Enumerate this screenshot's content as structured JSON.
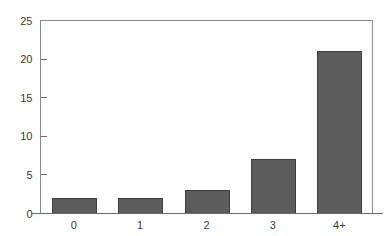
{
  "chart_data": {
    "type": "bar",
    "title": "",
    "subtitle": "",
    "xlabel": "",
    "ylabel": "",
    "categories": [
      "0",
      "1",
      "2",
      "3",
      "4+"
    ],
    "values": [
      2,
      2,
      3,
      7,
      21
    ],
    "series": [
      {
        "name": "",
        "values": [
          2,
          2,
          3,
          7,
          21
        ]
      }
    ],
    "ylim": [
      0,
      25
    ],
    "y_ticks": [
      0,
      5,
      10,
      15,
      20,
      25
    ],
    "y_tick_labels": [
      "0",
      "5",
      "10",
      "15",
      "20",
      "25"
    ],
    "x_tick_labels": [
      "0",
      "1",
      "2",
      "3",
      "4+"
    ],
    "grid": false,
    "legend": false,
    "legend_position": "none",
    "annotations": []
  },
  "style": {
    "bar_color": "#5c5c5c",
    "bar_edge_color": "#3f3f3f",
    "axis_color": "#6b6b6b",
    "frame_color": "#8a8a8a",
    "text_color": "#3a3a3a",
    "plot_background": "#ffffff",
    "figure_background": "#ffffff"
  }
}
